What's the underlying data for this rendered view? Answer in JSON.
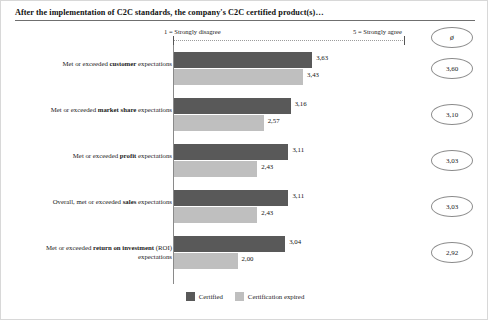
{
  "title": "After the implementation of C2C standards, the company's C2C certified product(s)…",
  "scale": {
    "left_label": "1 = Strongly disagree",
    "right_label": "5 = Strongly agree"
  },
  "avg_column": {
    "header_symbol": "ø"
  },
  "legend": {
    "items": [
      {
        "label": "Certified",
        "color": "#595959"
      },
      {
        "label": "Certification expired",
        "color": "#bfbfbf"
      }
    ]
  },
  "rows": [
    {
      "label_prefix": "Met or exceeded ",
      "label_bold": "customer",
      "label_suffix": " expectations",
      "certified": "3,63",
      "expired": "3,43",
      "average": "3,60"
    },
    {
      "label_prefix": "Met or exceeded ",
      "label_bold": "market share",
      "label_suffix": " expectations",
      "certified": "3,16",
      "expired": "2,57",
      "average": "3,10"
    },
    {
      "label_prefix": "Met or exceeded ",
      "label_bold": "profit",
      "label_suffix": " expectations",
      "certified": "3,11",
      "expired": "2,43",
      "average": "3,03"
    },
    {
      "label_prefix": "Overall, met or exceeded ",
      "label_bold": "sales",
      "label_suffix": " expectations",
      "certified": "3,11",
      "expired": "2,43",
      "average": "3,03"
    },
    {
      "label_prefix": "Met or exceeded ",
      "label_bold": "return on investment",
      "label_suffix": " (ROI) expectations",
      "certified": "3,04",
      "expired": "2,00",
      "average": "2,92"
    }
  ],
  "chart_data": {
    "type": "bar",
    "title": "After the implementation of C2C standards, the company's C2C certified product(s)…",
    "orientation": "horizontal",
    "xlabel": "",
    "ylabel": "",
    "xlim": [
      1,
      5
    ],
    "grid": false,
    "legend_position": "bottom",
    "scale_min_label": "1 = Strongly disagree",
    "scale_max_label": "5 = Strongly agree",
    "categories": [
      "Met or exceeded customer expectations",
      "Met or exceeded market share expectations",
      "Met or exceeded profit expectations",
      "Overall, met or exceeded sales expectations",
      "Met or exceeded return on investment (ROI) expectations"
    ],
    "series": [
      {
        "name": "Certified",
        "color": "#595959",
        "values": [
          3.63,
          3.16,
          3.11,
          3.11,
          3.04
        ],
        "value_labels": [
          "3,63",
          "3,16",
          "3,11",
          "3,11",
          "3,04"
        ]
      },
      {
        "name": "Certification expired",
        "color": "#bfbfbf",
        "values": [
          3.43,
          2.57,
          2.43,
          2.43,
          2.0
        ],
        "value_labels": [
          "3,43",
          "2,57",
          "2,43",
          "2,43",
          "2,00"
        ]
      }
    ],
    "annotations": {
      "average_column_header": "ø",
      "averages": [
        3.6,
        3.1,
        3.03,
        3.03,
        2.92
      ],
      "average_labels": [
        "3,60",
        "3,10",
        "3,03",
        "3,03",
        "2,92"
      ]
    }
  }
}
